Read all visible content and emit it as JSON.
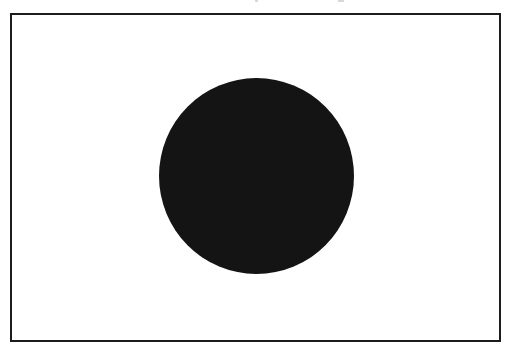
{
  "figure": {
    "colors": {
      "field": "#ffffff",
      "border": "#1c1c1c",
      "disc": "#141414"
    }
  }
}
